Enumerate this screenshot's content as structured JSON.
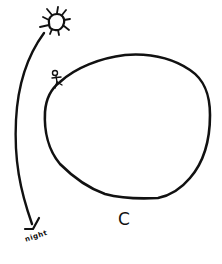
{
  "diagram": {
    "type": "hand-drawn sketch",
    "ink_color": "#111111",
    "background_color": "#ffffff",
    "elements": [
      {
        "id": "sun",
        "kind": "sun-icon",
        "position": "top-left"
      },
      {
        "id": "arc-arrow",
        "kind": "curved-arrow",
        "from": "sun",
        "to": "night"
      },
      {
        "id": "planet",
        "kind": "closed-blob",
        "label": "C"
      },
      {
        "id": "figure",
        "kind": "stick-figure",
        "position": "on upper-left edge of planet"
      }
    ]
  },
  "labels": {
    "night": "night",
    "planet": "C"
  }
}
